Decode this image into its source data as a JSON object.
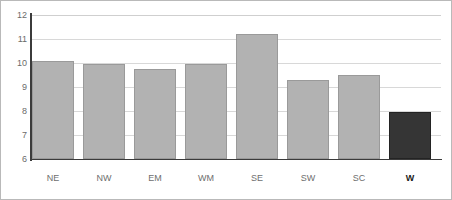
{
  "chart_data": {
    "type": "bar",
    "title": "",
    "subtitle": "",
    "xlabel": "",
    "ylabel": "",
    "categories": [
      "NE",
      "NW",
      "EM",
      "WM",
      "SE",
      "SW",
      "SC",
      "W"
    ],
    "values": [
      10.1,
      9.95,
      9.75,
      9.95,
      11.2,
      9.3,
      9.5,
      7.95
    ],
    "ylim": [
      6,
      12
    ],
    "ytick_labels": [
      "12",
      "11",
      "10",
      "9",
      "8",
      "7",
      "6"
    ],
    "ytick_values": [
      12,
      11,
      10,
      9,
      8,
      7,
      6
    ],
    "grid": true,
    "grid_axis": "y",
    "legend": false,
    "legend_position": "none",
    "highlight_category": "W",
    "bold_tick_labels": [
      "W"
    ],
    "colors": {
      "bar_fill": "#b2b2b2",
      "bar_border": "#9a9a9a",
      "highlight_fill": "#353535",
      "highlight_border": "#232323",
      "gridline": "#d8d8d8",
      "axis": "#3b3b3b",
      "tick_text": "#6e6e6e",
      "highlight_text": "#1a1a1a",
      "frame": "#b9b9b9",
      "background": "#ffffff"
    }
  }
}
